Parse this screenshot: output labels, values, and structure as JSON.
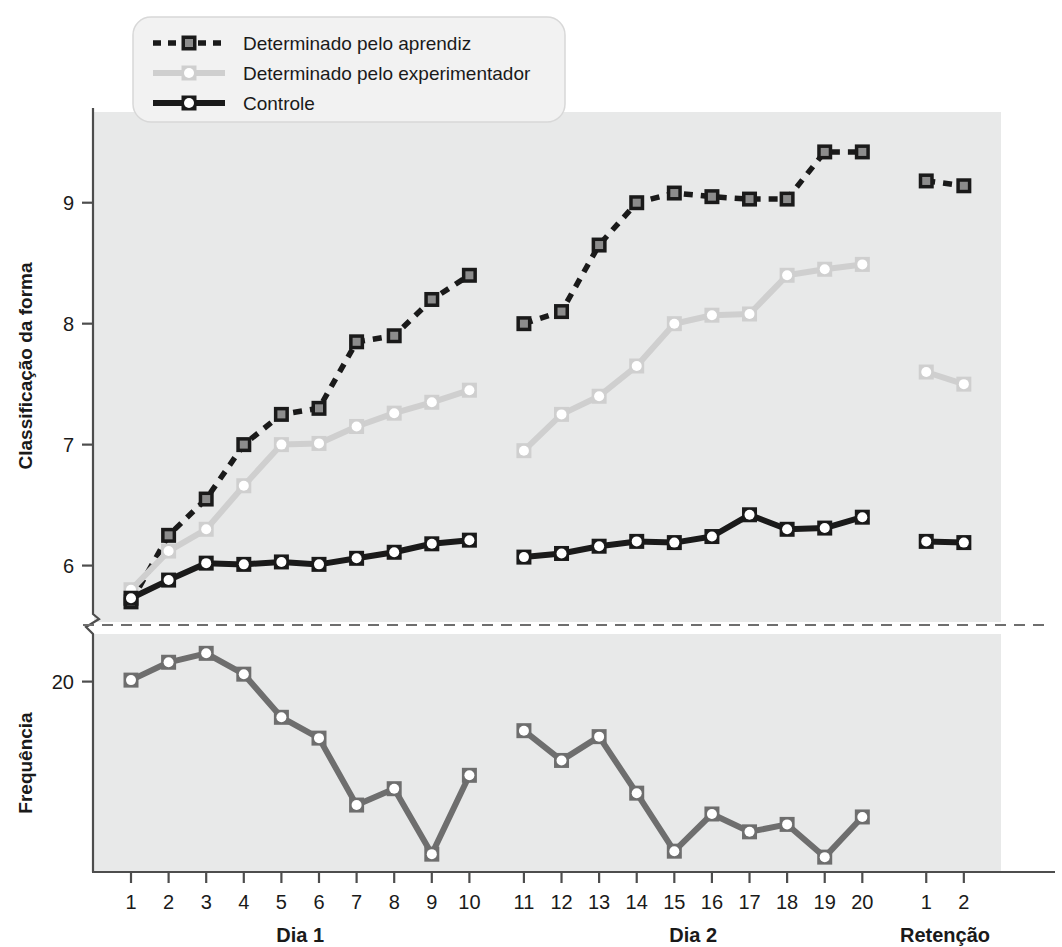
{
  "chart_data": {
    "type": "line",
    "title": "",
    "panels": [
      {
        "name": "top-panel",
        "ylabel": "Classificação da forma",
        "yticks": [
          6,
          7,
          8,
          9
        ],
        "ylim": [
          5.55,
          9.75
        ],
        "grid": false
      },
      {
        "name": "bottom-panel",
        "ylabel": "Frequência",
        "yticks": [
          20
        ],
        "ylim": [
          13.6,
          21.6
        ],
        "grid": false
      }
    ],
    "xlabel": "",
    "groups": [
      {
        "label": "Dia 1",
        "ticks": [
          "1",
          "2",
          "3",
          "4",
          "5",
          "6",
          "7",
          "8",
          "9",
          "10"
        ]
      },
      {
        "label": "Dia 2",
        "ticks": [
          "11",
          "12",
          "13",
          "14",
          "15",
          "16",
          "17",
          "18",
          "19",
          "20"
        ]
      },
      {
        "label": "Retenção",
        "ticks": [
          "1",
          "2"
        ]
      }
    ],
    "legend": {
      "position": "top-left",
      "entries": [
        {
          "label": "Determinado pelo aprendiz",
          "color": "#1a1a1a",
          "marker": "square",
          "marker_fill": "#8c8c8c",
          "dash": "dashed"
        },
        {
          "label": "Determinado pelo experimentador",
          "color": "#cfcfcf",
          "marker": "circle",
          "marker_fill": "#ffffff",
          "dash": "solid"
        },
        {
          "label": "Controle",
          "color": "#1a1a1a",
          "marker": "circle",
          "marker_fill": "#ffffff",
          "dash": "solid"
        }
      ]
    },
    "series": [
      {
        "name": "Determinado pelo aprendiz",
        "panel": "top-panel",
        "color": "#1a1a1a",
        "marker": "square",
        "marker_fill": "#8c8c8c",
        "dash": "dashed",
        "segments": [
          {
            "group": "Dia 1",
            "x": [
              1,
              2,
              3,
              4,
              5,
              6,
              7,
              8,
              9,
              10
            ],
            "values": [
              5.7,
              6.25,
              6.55,
              7.0,
              7.25,
              7.3,
              7.85,
              7.9,
              8.2,
              8.4
            ]
          },
          {
            "group": "Dia 2",
            "x": [
              11,
              12,
              13,
              14,
              15,
              16,
              17,
              18,
              19,
              20
            ],
            "values": [
              8.0,
              8.1,
              8.65,
              9.0,
              9.08,
              9.05,
              9.03,
              9.03,
              9.42,
              9.42
            ]
          },
          {
            "group": "Retenção",
            "x": [
              1,
              2
            ],
            "values": [
              9.18,
              9.14
            ]
          }
        ]
      },
      {
        "name": "Determinado pelo experimentador",
        "panel": "top-panel",
        "color": "#cfcfcf",
        "marker": "circle",
        "marker_fill": "#ffffff",
        "dash": "solid",
        "segments": [
          {
            "group": "Dia 1",
            "x": [
              1,
              2,
              3,
              4,
              5,
              6,
              7,
              8,
              9,
              10
            ],
            "values": [
              5.8,
              6.12,
              6.3,
              6.66,
              7.0,
              7.01,
              7.15,
              7.26,
              7.35,
              7.45
            ]
          },
          {
            "group": "Dia 2",
            "x": [
              11,
              12,
              13,
              14,
              15,
              16,
              17,
              18,
              19,
              20
            ],
            "values": [
              6.95,
              7.25,
              7.4,
              7.65,
              8.0,
              8.07,
              8.08,
              8.4,
              8.45,
              8.49
            ]
          },
          {
            "group": "Retenção",
            "x": [
              1,
              2
            ],
            "values": [
              7.6,
              7.5
            ]
          }
        ]
      },
      {
        "name": "Controle",
        "panel": "top-panel",
        "color": "#1a1a1a",
        "marker": "circle",
        "marker_fill": "#ffffff",
        "dash": "solid",
        "segments": [
          {
            "group": "Dia 1",
            "x": [
              1,
              2,
              3,
              4,
              5,
              6,
              7,
              8,
              9,
              10
            ],
            "values": [
              5.73,
              5.88,
              6.02,
              6.01,
              6.03,
              6.01,
              6.06,
              6.11,
              6.18,
              6.21
            ]
          },
          {
            "group": "Dia 2",
            "x": [
              11,
              12,
              13,
              14,
              15,
              16,
              17,
              18,
              19,
              20
            ],
            "values": [
              6.07,
              6.1,
              6.16,
              6.2,
              6.19,
              6.24,
              6.42,
              6.3,
              6.31,
              6.4
            ]
          },
          {
            "group": "Retenção",
            "x": [
              1,
              2
            ],
            "values": [
              6.2,
              6.19
            ]
          }
        ]
      },
      {
        "name": "Frequência",
        "panel": "bottom-panel",
        "color": "#6e6e6e",
        "marker": "circle",
        "marker_fill": "#ffffff",
        "dash": "solid",
        "segments": [
          {
            "group": "Dia 1",
            "x": [
              1,
              2,
              3,
              4,
              5,
              6,
              7,
              8,
              9,
              10
            ],
            "values": [
              20.05,
              20.65,
              20.95,
              20.25,
              18.8,
              18.1,
              15.85,
              16.4,
              14.2,
              16.85
            ]
          },
          {
            "group": "Dia 2",
            "x": [
              11,
              12,
              13,
              14,
              15,
              16,
              17,
              18,
              19,
              20
            ],
            "values": [
              18.35,
              17.35,
              18.15,
              16.25,
              14.3,
              15.55,
              14.95,
              15.2,
              14.1,
              15.45
            ]
          },
          {
            "group": "Retenção",
            "x": [
              1,
              2
            ],
            "values": []
          }
        ]
      }
    ]
  },
  "colors": {
    "plot_background": "#e8e9e9",
    "page_background": "#ffffff",
    "axis": "#4d4d4d",
    "legend_background": "#f2f2f2",
    "learner": "#1a1a1a",
    "learner_fill": "#8c8c8c",
    "experimenter": "#cfcfcf",
    "control": "#1a1a1a",
    "frequency": "#6e6e6e"
  },
  "labels": {
    "y_top": "Classificação da forma",
    "y_bottom": "Frequência"
  }
}
